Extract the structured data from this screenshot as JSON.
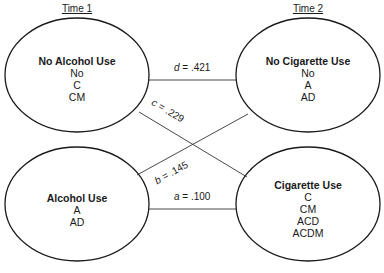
{
  "headers": {
    "time1": "Time 1",
    "time2": "Time 2"
  },
  "nodes": {
    "no_alcohol": {
      "title": "No Alcohol Use",
      "items": [
        "No",
        "C",
        "CM"
      ]
    },
    "no_cigarette": {
      "title": "No Cigarette Use",
      "items": [
        "No",
        "A",
        "AD"
      ]
    },
    "alcohol": {
      "title": "Alcohol Use",
      "items": [
        "A",
        "AD"
      ]
    },
    "cigarette": {
      "title": "Cigarette Use",
      "items": [
        "C",
        "CM",
        "ACD",
        "ACDM"
      ]
    }
  },
  "edges": {
    "d": {
      "var": "d",
      "value": ".421",
      "from": "No Alcohol Use",
      "to": "No Cigarette Use"
    },
    "c": {
      "var": "c",
      "value": ".229",
      "from": "No Alcohol Use",
      "to": "Cigarette Use"
    },
    "b": {
      "var": "b",
      "value": ".145",
      "from": "Alcohol Use",
      "to": "No Cigarette Use"
    },
    "a": {
      "var": "a",
      "value": ".100",
      "from": "Alcohol Use",
      "to": "Cigarette Use"
    }
  }
}
